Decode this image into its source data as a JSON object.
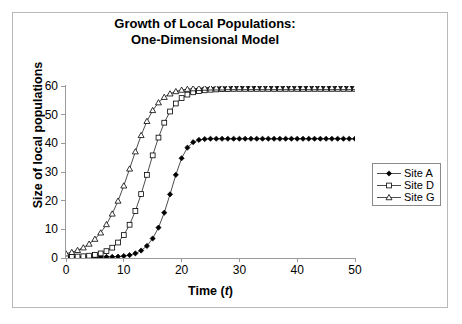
{
  "chart_data": {
    "type": "line",
    "title": "Growth of Local Populations: One-Dimensional Model",
    "title_lines": [
      "Growth of Local Populations:",
      "One-Dimensional Model"
    ],
    "xlabel": "Time (t)",
    "xlabel_prefix": "Time (",
    "xlabel_italic": "t",
    "xlabel_suffix": ")",
    "ylabel": "Size of local populations",
    "xlim": [
      0,
      50
    ],
    "ylim": [
      0,
      60
    ],
    "xticks": [
      0,
      10,
      20,
      30,
      40,
      50
    ],
    "yticks": [
      0,
      10,
      20,
      30,
      40,
      50,
      60
    ],
    "grid": false,
    "legend_position": "right",
    "x": [
      0,
      1,
      2,
      3,
      4,
      5,
      6,
      7,
      8,
      9,
      10,
      11,
      12,
      13,
      14,
      15,
      16,
      17,
      18,
      19,
      20,
      21,
      22,
      23,
      24,
      25,
      26,
      27,
      28,
      29,
      30,
      31,
      32,
      33,
      34,
      35,
      36,
      37,
      38,
      39,
      40,
      41,
      42,
      43,
      44,
      45,
      46,
      47,
      48,
      49,
      50
    ],
    "series": [
      {
        "name": "Site A",
        "marker": "filled-diamond",
        "color": "#000000",
        "values": [
          0.3,
          0.3,
          0.3,
          0.3,
          0.3,
          0.3,
          0.3,
          0.4,
          0.4,
          0.5,
          0.7,
          1.0,
          1.6,
          2.6,
          4.2,
          6.8,
          10.6,
          15.8,
          22.2,
          29.0,
          34.8,
          38.5,
          40.4,
          41.2,
          41.5,
          41.6,
          41.6,
          41.6,
          41.6,
          41.6,
          41.6,
          41.6,
          41.6,
          41.6,
          41.6,
          41.6,
          41.6,
          41.6,
          41.6,
          41.6,
          41.6,
          41.6,
          41.6,
          41.6,
          41.6,
          41.6,
          41.6,
          41.6,
          41.6,
          41.6,
          41.6
        ]
      },
      {
        "name": "Site D",
        "marker": "open-square",
        "color": "#000000",
        "values": [
          0.3,
          0.4,
          0.5,
          0.6,
          0.8,
          1.1,
          1.6,
          2.4,
          3.6,
          5.4,
          8.0,
          11.6,
          16.4,
          22.3,
          29.0,
          35.8,
          42.0,
          47.2,
          51.1,
          53.9,
          55.8,
          57.0,
          57.8,
          58.2,
          58.5,
          58.7,
          58.8,
          58.9,
          58.9,
          59.0,
          59.0,
          59.0,
          59.0,
          59.0,
          59.0,
          59.0,
          59.0,
          59.0,
          59.0,
          59.0,
          59.0,
          59.0,
          59.0,
          59.0,
          59.0,
          59.0,
          59.0,
          59.0,
          59.0,
          59.0,
          59.0
        ]
      },
      {
        "name": "Site G",
        "marker": "open-triangle",
        "color": "#000000",
        "values": [
          1.5,
          2.0,
          2.7,
          3.6,
          4.9,
          6.6,
          8.8,
          11.7,
          15.4,
          19.9,
          25.2,
          31.1,
          37.1,
          42.8,
          47.7,
          51.5,
          54.2,
          56.1,
          57.3,
          58.1,
          58.6,
          58.9,
          59.1,
          59.2,
          59.3,
          59.4,
          59.4,
          59.4,
          59.5,
          59.5,
          59.5,
          59.5,
          59.5,
          59.5,
          59.5,
          59.5,
          59.5,
          59.5,
          59.5,
          59.5,
          59.5,
          59.5,
          59.5,
          59.5,
          59.5,
          59.5,
          59.5,
          59.5,
          59.5,
          59.5,
          59.5
        ]
      }
    ],
    "legend_entries": [
      "Site A",
      "Site D",
      "Site G"
    ]
  },
  "legend": {
    "items": [
      {
        "label": "Site A",
        "marker": "filled-diamond"
      },
      {
        "label": "Site D",
        "marker": "open-square"
      },
      {
        "label": "Site G",
        "marker": "open-triangle"
      }
    ]
  },
  "axes": {
    "y_tick_labels": [
      "60",
      "50",
      "40",
      "30",
      "20",
      "10",
      "0"
    ],
    "x_tick_labels": [
      "0",
      "10",
      "20",
      "30",
      "40",
      "50"
    ]
  },
  "colors": {
    "line": "#000000",
    "axis": "#9a9a9a",
    "frame": "#b9b9b9",
    "legend_border": "#8a8a8a",
    "background": "#ffffff"
  }
}
